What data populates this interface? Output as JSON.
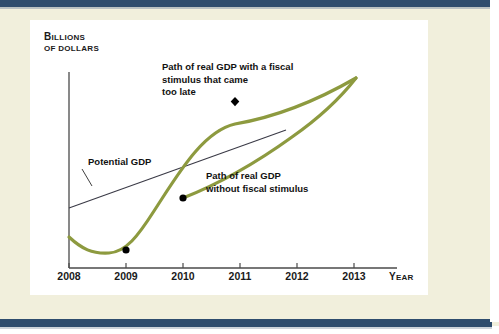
{
  "figure": {
    "background_color": "#f1efdc",
    "panel_color": "#ffffff",
    "rule_color": "#2e4c6d",
    "curve_color": "#8d9a3f",
    "potential_line_color": "#3a3a46"
  },
  "axes": {
    "ylabel_line1": "Billions",
    "ylabel_line2": "of dollars",
    "xlabel": "Year",
    "xticks": [
      "2008",
      "2009",
      "2010",
      "2011",
      "2012",
      "2013"
    ]
  },
  "annotations": {
    "late_stimulus": "Path of real GDP with a fiscal\nstimulus that came\ntoo late",
    "no_stimulus": "Path of real GDP\nwithout fiscal stimulus",
    "potential_gdp": "Potential GDP"
  },
  "chart_data": {
    "type": "line",
    "title": "",
    "xlabel": "Year",
    "ylabel": "Billions of dollars",
    "grid": false,
    "legend": "annotations-inline",
    "xlim": [
      2008,
      2013.6
    ],
    "ylim": [
      0,
      100
    ],
    "xticks": [
      2008,
      2009,
      2010,
      2011,
      2012,
      2013
    ],
    "series": [
      {
        "name": "Potential GDP",
        "type": "line",
        "style": "thin-black",
        "color": "#3a3a46",
        "x": [
          2008.0,
          2011.45
        ],
        "values": [
          30.5,
          68.0
        ]
      },
      {
        "name": "Path of real GDP with a fiscal stimulus that came too late",
        "type": "line",
        "style": "thick-olive",
        "color": "#8d9a3f",
        "x": [
          2008.0,
          2008.6,
          2009.0,
          2009.6,
          2010.0,
          2010.4,
          2010.85,
          2011.6,
          2012.4,
          2013.0
        ],
        "values": [
          45.0,
          37.0,
          34.5,
          47.0,
          59.0,
          74.0,
          84.5,
          87.0,
          91.0,
          96.5
        ]
      },
      {
        "name": "Path of real GDP without fiscal stimulus",
        "type": "line",
        "style": "thick-olive",
        "color": "#8d9a3f",
        "x": [
          2010.0,
          2010.7,
          2011.45,
          2012.2,
          2013.0
        ],
        "values": [
          59.0,
          63.5,
          68.5,
          80.0,
          96.5
        ]
      }
    ],
    "markers": [
      {
        "name": "trough-2009",
        "shape": "circle",
        "x": 2009.0,
        "y": 34.5,
        "color": "#000000"
      },
      {
        "name": "branch-2010",
        "shape": "circle",
        "x": 2010.0,
        "y": 59.0,
        "color": "#000000"
      },
      {
        "name": "stimulus-arrival-2011",
        "shape": "diamond",
        "x": 2010.85,
        "y": 84.5,
        "color": "#000000"
      }
    ]
  }
}
